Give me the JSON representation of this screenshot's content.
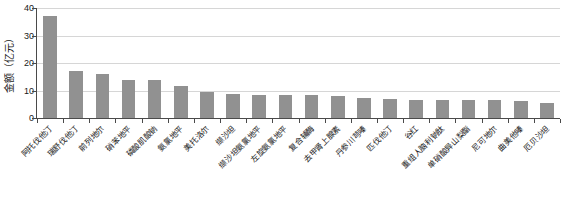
{
  "chart_data": {
    "type": "bar",
    "title": "",
    "subtitle": "",
    "xlabel": "",
    "ylabel": "金额（亿元）",
    "ylim": [
      0,
      40
    ],
    "yticks": [
      0,
      10,
      20,
      30,
      40
    ],
    "grid": true,
    "legend": false,
    "legend_position": "none",
    "bar_color": "#919191",
    "axis_color": "#4a4a4a",
    "gridline_color": "#d6d6d6",
    "categories": [
      "阿托伐他汀",
      "瑞舒伐他汀",
      "前列地尔",
      "硝苯地平",
      "磷酸肌酸钠",
      "氨氯地平",
      "美托洛尔",
      "缬沙坦",
      "缬沙坦氨氯地平",
      "左旋氨氯地平",
      "复合辅酶",
      "去甲肾上腺素",
      "丹参川芎嗪",
      "匹伐他汀",
      "谷红",
      "重组人脑利钠肽",
      "单硝酸异山梨酯",
      "尼可地尔",
      "曲美他嗪",
      "厄贝沙坦"
    ],
    "values": [
      37,
      17,
      16,
      14,
      13.7,
      11.8,
      9.5,
      8.6,
      8.4,
      8.3,
      8.2,
      8.1,
      7.4,
      6.8,
      6.6,
      6.6,
      6.5,
      6.4,
      6.2,
      5.6
    ]
  }
}
